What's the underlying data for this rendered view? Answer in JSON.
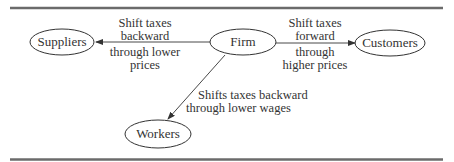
{
  "diagram": {
    "nodes": [
      {
        "id": "suppliers",
        "label": "Suppliers"
      },
      {
        "id": "firm",
        "label": "Firm"
      },
      {
        "id": "customers",
        "label": "Customers"
      },
      {
        "id": "workers",
        "label": "Workers"
      }
    ],
    "edges": [
      {
        "from": "firm",
        "to": "suppliers",
        "label_top": "Shift taxes\nbackward",
        "label_top_lines": [
          "Shift taxes",
          "backward"
        ],
        "label_bottom_lines": [
          "through lower",
          "prices"
        ]
      },
      {
        "from": "firm",
        "to": "customers",
        "label_top_lines": [
          "Shift taxes",
          "forward"
        ],
        "label_bottom_lines": [
          "through",
          "higher prices"
        ]
      },
      {
        "from": "firm",
        "to": "workers",
        "label_lines": [
          "Shifts taxes backward",
          "through lower wages"
        ]
      }
    ],
    "colors": {
      "rule": "#6b6b6b",
      "stroke": "#333333",
      "text": "#333333"
    }
  }
}
